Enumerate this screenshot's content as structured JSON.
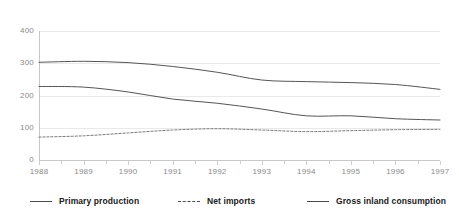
{
  "chart_data": {
    "type": "line",
    "title": "",
    "subtitle": "",
    "xlabel": "",
    "ylabel": "",
    "categories": [
      "1988",
      "1989",
      "1990",
      "1991",
      "1992",
      "1993",
      "1994",
      "1995",
      "1996",
      "1997"
    ],
    "x": [
      1988,
      1989,
      1990,
      1991,
      1992,
      1993,
      1994,
      1995,
      1996,
      1997
    ],
    "ylim": [
      0,
      400
    ],
    "xlim": [
      1988,
      1997
    ],
    "yticks": [
      0,
      100,
      200,
      300,
      400
    ],
    "ytick_labels": [
      "0",
      "100",
      "200",
      "300",
      "400"
    ],
    "grid": true,
    "legend_position": "bottom",
    "series": [
      {
        "name": "Primary production",
        "style": "solid",
        "color": "#555555",
        "values": [
          228,
          226,
          211,
          189,
          176,
          158,
          137,
          137,
          128,
          124
        ]
      },
      {
        "name": "Net imports",
        "style": "dashed",
        "color": "#777777",
        "values": [
          71,
          75,
          84,
          93,
          97,
          93,
          88,
          91,
          94,
          95
        ]
      },
      {
        "name": "Gross inland consumption",
        "style": "solid",
        "color": "#555555",
        "values": [
          303,
          306,
          302,
          290,
          272,
          248,
          243,
          240,
          234,
          219
        ]
      }
    ]
  },
  "axes": {
    "y_ticks": [
      "0",
      "100",
      "200",
      "300",
      "400"
    ],
    "x_ticks": [
      "1988",
      "1989",
      "1990",
      "1991",
      "1992",
      "1993",
      "1994",
      "1995",
      "1996",
      "1997"
    ]
  },
  "legend": {
    "items": [
      {
        "label": "Primary production",
        "style": "solid"
      },
      {
        "label": "Net imports",
        "style": "dashed"
      },
      {
        "label": "Gross inland consumption",
        "style": "solid"
      }
    ]
  },
  "colors": {
    "grid": "#e9e9e9",
    "axis": "#c8c8c8",
    "tick_text": "#8a8a8a",
    "legend_text": "#1a1a1a",
    "line": "#555555",
    "background": "#ffffff"
  }
}
